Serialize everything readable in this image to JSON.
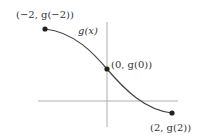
{
  "diagram": {
    "function_label": "g(x)",
    "points": [
      {
        "label": "(−2, g(−2))",
        "x": -2
      },
      {
        "label": "(0, g(0))",
        "x": 0
      },
      {
        "label": "(2, g(2))",
        "x": 2
      }
    ],
    "colors": {
      "curve": "#444444",
      "axis": "#999999",
      "point": "#222222"
    }
  }
}
